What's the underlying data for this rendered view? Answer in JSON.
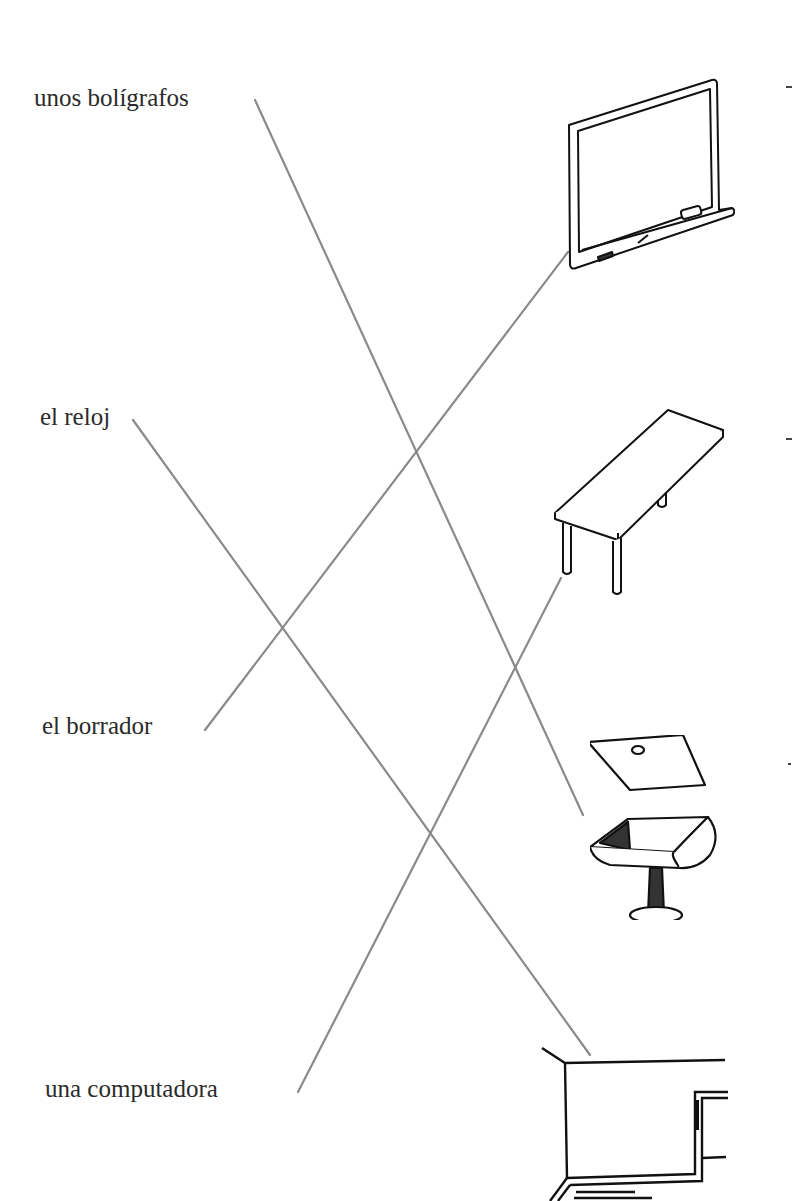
{
  "exercise": {
    "words": [
      {
        "id": "boligrafos",
        "label": "unos bolígrafos"
      },
      {
        "id": "reloj",
        "label": "el reloj"
      },
      {
        "id": "borrador",
        "label": "el borrador"
      },
      {
        "id": "computadora",
        "label": "una computadora"
      }
    ],
    "pictures": [
      {
        "id": "chalkboard",
        "icon": "chalkboard-icon"
      },
      {
        "id": "table",
        "icon": "table-icon"
      },
      {
        "id": "student-desk",
        "icon": "student-desk-icon"
      },
      {
        "id": "teacher-desk",
        "icon": "teacher-desk-icon"
      }
    ],
    "matches": [
      {
        "from": "unos bolígrafos",
        "to": "student-desk"
      },
      {
        "from": "el reloj",
        "to": "teacher-desk"
      },
      {
        "from": "el borrador",
        "to": "chalkboard"
      },
      {
        "from": "una computadora",
        "to": "table"
      }
    ],
    "line_color": "#8a8a8a"
  }
}
